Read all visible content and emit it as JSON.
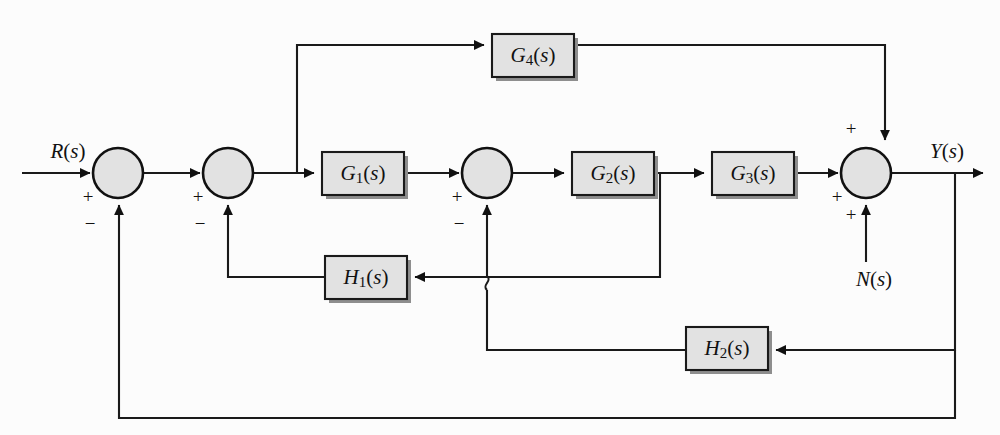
{
  "diagram": {
    "type": "block-diagram",
    "signals": {
      "input": "R(s)",
      "output": "Y(s)",
      "disturbance": "N(s)"
    },
    "blocks": [
      {
        "id": "G4",
        "base": "G",
        "sub": "4",
        "arg": "(s)",
        "label": "G4(s)",
        "x": 492,
        "y": 34,
        "w": 82,
        "h": 43
      },
      {
        "id": "G1",
        "base": "G",
        "sub": "1",
        "arg": "(s)",
        "label": "G1(s)",
        "x": 322,
        "y": 152,
        "w": 82,
        "h": 43
      },
      {
        "id": "G2",
        "base": "G",
        "sub": "2",
        "arg": "(s)",
        "label": "G2(s)",
        "x": 572,
        "y": 152,
        "w": 82,
        "h": 43
      },
      {
        "id": "G3",
        "base": "G",
        "sub": "3",
        "arg": "(s)",
        "label": "G3(s)",
        "x": 712,
        "y": 152,
        "w": 82,
        "h": 43
      },
      {
        "id": "H1",
        "base": "H",
        "sub": "1",
        "arg": "(s)",
        "label": "H1(s)",
        "x": 325,
        "y": 256,
        "w": 82,
        "h": 43
      },
      {
        "id": "H2",
        "base": "H",
        "sub": "2",
        "arg": "(s)",
        "label": "H2(s)",
        "x": 686,
        "y": 327,
        "w": 82,
        "h": 43
      }
    ],
    "summing_junctions": [
      {
        "id": "sum1",
        "cx": 118,
        "cy": 173,
        "r": 25,
        "signs": [
          {
            "text": "+",
            "x": 88,
            "y": 199
          },
          {
            "text": "−",
            "x": 90,
            "y": 226
          }
        ]
      },
      {
        "id": "sum2",
        "cx": 228,
        "cy": 173,
        "r": 25,
        "signs": [
          {
            "text": "+",
            "x": 198,
            "y": 199
          },
          {
            "text": "−",
            "x": 200,
            "y": 226
          }
        ]
      },
      {
        "id": "sum3",
        "cx": 487,
        "cy": 173,
        "r": 25,
        "signs": [
          {
            "text": "+",
            "x": 457,
            "y": 199
          },
          {
            "text": "−",
            "x": 459,
            "y": 226
          }
        ]
      },
      {
        "id": "sum4",
        "cx": 866,
        "cy": 173,
        "r": 25,
        "signs": [
          {
            "text": "+",
            "x": 851,
            "y": 131
          },
          {
            "text": "+",
            "x": 837,
            "y": 199
          },
          {
            "text": "+",
            "x": 851,
            "y": 217
          }
        ]
      }
    ],
    "labels": {
      "input_x": 68,
      "input_y": 158,
      "output_x": 947,
      "output_y": 158,
      "noise_x": 874,
      "noise_y": 279
    },
    "colors": {
      "block_fill": "#e2e2e2",
      "block_stroke": "#1a1a1a",
      "wire": "#1a1a1a",
      "background": "#fcfcfc",
      "shadow": "#8e8e8e"
    }
  }
}
